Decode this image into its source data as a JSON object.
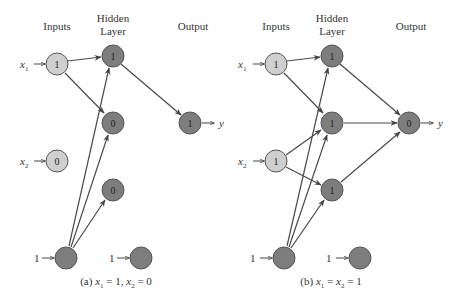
{
  "colors": {
    "input_node": "#cfcfcf",
    "hidden_node": "#7d7d7d",
    "bias_node": "#7d7d7d",
    "stroke": "#444444",
    "edge": "#4a4a4a"
  },
  "headers": {
    "inputs": "Inputs",
    "hidden_line1": "Hidden",
    "hidden_line2": "Layer",
    "output": "Output"
  },
  "panels": [
    {
      "id": "a",
      "caption_prefix": "(a) ",
      "caption": "(a) x1 = 1, x2 = 0",
      "caption_parts": [
        "(a) ",
        "x",
        "1",
        " = 1, ",
        "x",
        "2",
        " = 0"
      ],
      "inputs": [
        {
          "label": "x",
          "sub": "1",
          "value": "1"
        },
        {
          "label": "x",
          "sub": "2",
          "value": "0"
        }
      ],
      "input_bias_label": "1",
      "hidden": [
        {
          "value": "1"
        },
        {
          "value": "0"
        },
        {
          "value": "0"
        }
      ],
      "hidden_bias_label": "1",
      "output": {
        "value": "1",
        "label": "y"
      }
    },
    {
      "id": "b",
      "caption": "(b) x1 = x2 = 1",
      "caption_parts": [
        "(b) ",
        "x",
        "1",
        " = ",
        "x",
        "2",
        " = 1"
      ],
      "inputs": [
        {
          "label": "x",
          "sub": "1",
          "value": "1"
        },
        {
          "label": "x",
          "sub": "2",
          "value": "1"
        }
      ],
      "input_bias_label": "1",
      "hidden": [
        {
          "value": "1"
        },
        {
          "value": "1"
        },
        {
          "value": "1"
        }
      ],
      "hidden_bias_label": "1",
      "output": {
        "value": "0",
        "label": "y"
      }
    }
  ]
}
